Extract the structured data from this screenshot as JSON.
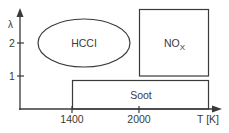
{
  "diagram": {
    "y_axis": {
      "label": "λ",
      "ticks": [
        {
          "label": "2"
        },
        {
          "label": "1"
        }
      ]
    },
    "x_axis": {
      "label": "T [K]",
      "ticks": [
        {
          "label": "1400"
        },
        {
          "label": "2000"
        }
      ]
    },
    "regions": {
      "hccl": {
        "label": "HCCI"
      },
      "nox": {
        "label": "NO",
        "subscript": "X"
      },
      "soot": {
        "label": "Soot"
      }
    },
    "colors": {
      "line": "#3a3a3a",
      "background": "#ffffff"
    }
  }
}
